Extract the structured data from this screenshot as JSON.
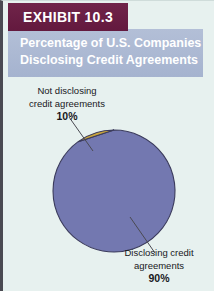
{
  "exhibit": {
    "tag_label": "EXHIBIT 10.3",
    "title_line_1": "Percentage of U.S. Companies",
    "title_line_2": "Disclosing Credit Agreements"
  },
  "colors": {
    "exhibit_tag_bg": "#6b2145",
    "title_band_bg": "#aebbd4",
    "figure_bg": "#e7f1ef",
    "slice_disclosing": "#7378b0",
    "slice_not_disclosing": "#c9a53c",
    "slice_outline": "#3b3b5c",
    "leader_line": "#4a4a52",
    "title_text": "#ffffff",
    "label_text": "#18181c"
  },
  "callouts": {
    "not_disclosing": {
      "line_1": "Not disclosing",
      "line_2": "credit agreements",
      "percent": "10%"
    },
    "disclosing": {
      "line_1": "Disclosing credit",
      "line_2": "agreements",
      "percent": "90%"
    }
  },
  "chart_data": {
    "type": "pie",
    "title": "Percentage of U.S. Companies Disclosing Credit Agreements",
    "xlabel": "",
    "ylabel": "",
    "categories": [
      "Disclosing credit agreements",
      "Not disclosing credit agreements"
    ],
    "values": [
      90,
      10
    ],
    "value_labels": [
      "90%",
      "10%"
    ],
    "colors": [
      "#7378b0",
      "#c9a53c"
    ],
    "units": "percent",
    "total": 100,
    "start_angle_deg": 0,
    "direction": "counterclockwise",
    "legend": "none",
    "grid": false,
    "annotations": [
      "Not disclosing credit agreements 10%",
      "Disclosing credit agreements 90%"
    ]
  }
}
